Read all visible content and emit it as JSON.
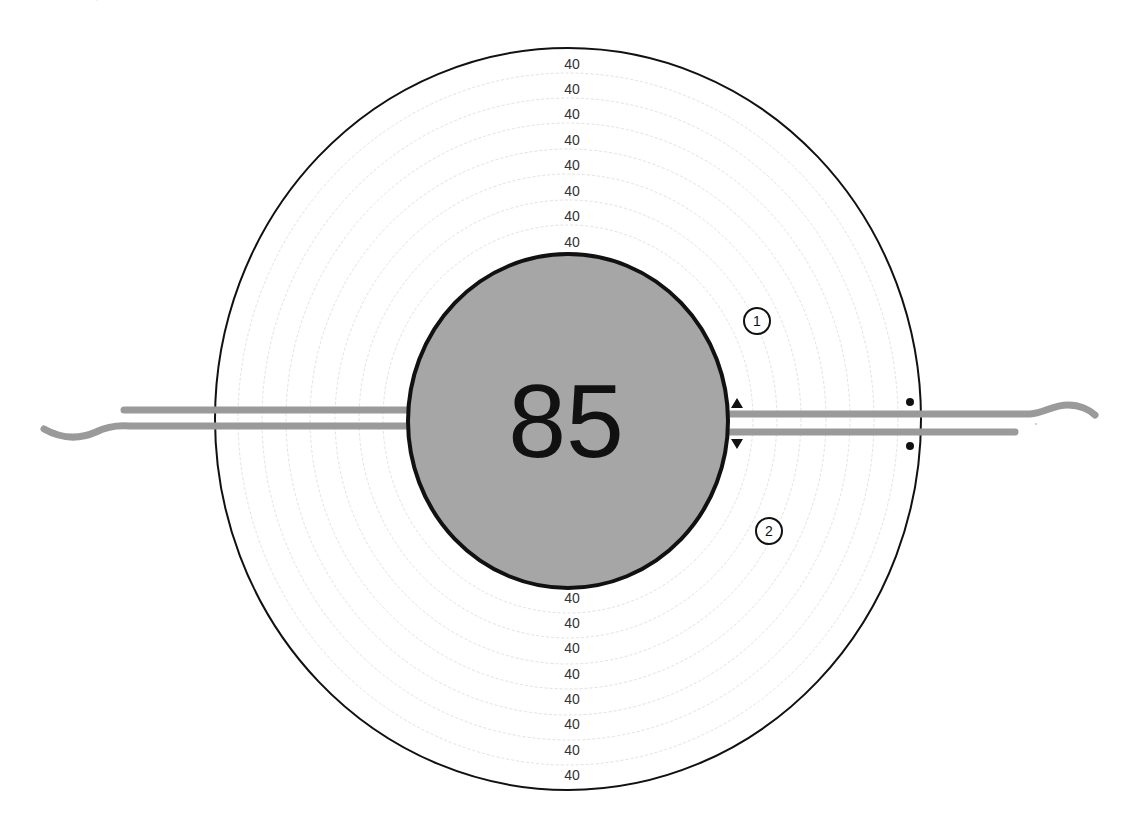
{
  "diagram": {
    "top_caption_partial": "· —— —— — ——— ——— ",
    "center_value": "85",
    "ring_labels_top": [
      "40",
      "40",
      "40",
      "40",
      "40",
      "40",
      "40",
      "40"
    ],
    "ring_labels_bottom": [
      "40",
      "40",
      "40",
      "40",
      "40",
      "40",
      "40",
      "40"
    ],
    "markers": [
      {
        "id": "marker-1",
        "label": "1"
      },
      {
        "id": "marker-2",
        "label": "2"
      }
    ],
    "colors": {
      "inner_fill": "#a6a6a6",
      "outline": "#111111",
      "bar": "#9a9a9a",
      "ring": "#e4e4e4",
      "label": "#333333"
    }
  }
}
